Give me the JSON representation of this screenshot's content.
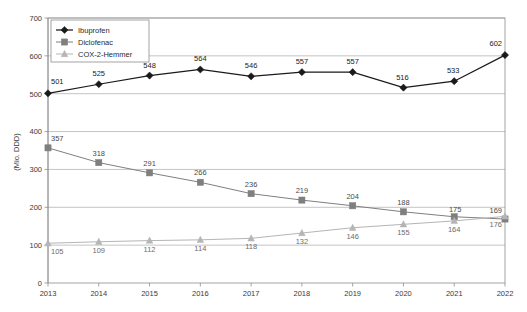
{
  "chart_data": {
    "type": "line",
    "title": "",
    "xlabel": "",
    "ylabel": "(Mio. DDD)",
    "categories": [
      "2013",
      "2014",
      "2015",
      "2016",
      "2017",
      "2018",
      "2019",
      "2020",
      "2021",
      "2022"
    ],
    "x": [
      2013,
      2014,
      2015,
      2016,
      2017,
      2018,
      2019,
      2020,
      2021,
      2022
    ],
    "ylim": [
      0,
      700
    ],
    "ytick_labels": [
      "0",
      "100",
      "200",
      "300",
      "400",
      "500",
      "600",
      "700"
    ],
    "ytick_values": [
      0,
      100,
      200,
      300,
      400,
      500,
      600,
      700
    ],
    "grid": "horizontal",
    "legend_position": "top-left",
    "series": [
      {
        "name": "Ibuprofen",
        "marker": "diamond",
        "color": "#1a1a1a",
        "values": [
          501,
          525,
          548,
          564,
          546,
          557,
          557,
          516,
          533,
          602
        ],
        "labels": [
          "501",
          "525",
          "548",
          "564",
          "546",
          "557",
          "557",
          "516",
          "533",
          "602"
        ]
      },
      {
        "name": "Diclofenac",
        "marker": "square",
        "color": "#7f7f7f",
        "values": [
          357,
          318,
          291,
          266,
          236,
          219,
          204,
          188,
          175,
          169
        ],
        "labels": [
          "357",
          "318",
          "291",
          "266",
          "236",
          "219",
          "204",
          "188",
          "175",
          "169"
        ]
      },
      {
        "name": "COX-2-Hemmer",
        "marker": "triangle",
        "color": "#b5b5b5",
        "values": [
          105,
          109,
          112,
          114,
          118,
          132,
          146,
          155,
          164,
          176
        ],
        "labels": [
          "105",
          "109",
          "112",
          "114",
          "118",
          "132",
          "146",
          "155",
          "164",
          "176"
        ]
      }
    ]
  },
  "legend": {
    "items": [
      {
        "label": "Ibuprofen"
      },
      {
        "label": "Diclofenac"
      },
      {
        "label": "COX-2-Hemmer"
      }
    ]
  }
}
